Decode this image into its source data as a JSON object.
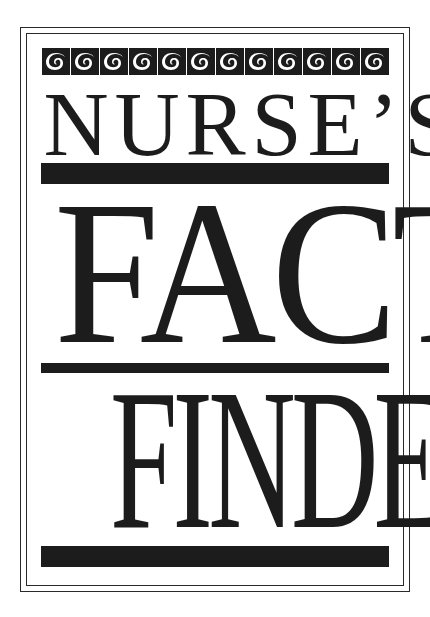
{
  "cover": {
    "title_line_1": "NURSE’S",
    "title_line_2": "FACT",
    "title_line_3": "FINDER",
    "ornament": {
      "icon": "wave-scroll-icon",
      "tile_count": 12
    },
    "colors": {
      "ink": "#1c1c1c",
      "paper": "#ffffff"
    }
  }
}
